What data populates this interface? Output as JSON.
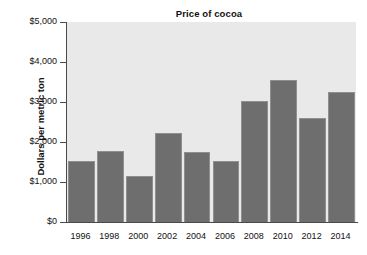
{
  "chart_data": {
    "type": "bar",
    "title": "Price of cocoa",
    "xlabel": "",
    "ylabel": "Dollars per metric ton",
    "categories": [
      "1996",
      "1998",
      "2000",
      "2002",
      "2004",
      "2006",
      "2008",
      "2010",
      "2012",
      "2014"
    ],
    "values": [
      1525,
      1775,
      1150,
      2225,
      1750,
      1525,
      3025,
      3550,
      2600,
      3250
    ],
    "ylim": [
      0,
      5000
    ],
    "ytick_values": [
      0,
      1000,
      2000,
      3000,
      4000,
      5000
    ],
    "ytick_labels": [
      "$0",
      "$1,000",
      "$2,000",
      "$3,000",
      "$4,000",
      "$5,000"
    ],
    "grid": false,
    "legend": "none",
    "bar_color": "#6e6e6e",
    "plot_background": "#e9e9e9",
    "axis_color": "#4a4a4a",
    "figure_background": "#ffffff"
  }
}
